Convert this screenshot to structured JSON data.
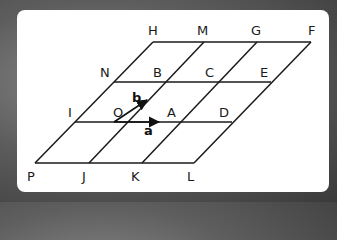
{
  "diagram": {
    "type": "parallelogram-grid",
    "line_color": "#1a1a1a",
    "background_color": "#ffffff",
    "points": {
      "H": "H",
      "M": "M",
      "G": "G",
      "F": "F",
      "N": "N",
      "B": "B",
      "C": "C",
      "E": "E",
      "I": "I",
      "O": "O",
      "A": "A",
      "D": "D",
      "P": "P",
      "J": "J",
      "K": "K",
      "L": "L"
    },
    "vectors": {
      "a": {
        "label": "a",
        "from": "O",
        "to": "A"
      },
      "b": {
        "label": "b",
        "from": "O",
        "to": "B"
      }
    },
    "rows": [
      [
        "H",
        "M",
        "G",
        "F"
      ],
      [
        "N",
        "B",
        "C",
        "E"
      ],
      [
        "I",
        "O",
        "A",
        "D"
      ],
      [
        "P",
        "J",
        "K",
        "L"
      ]
    ]
  }
}
